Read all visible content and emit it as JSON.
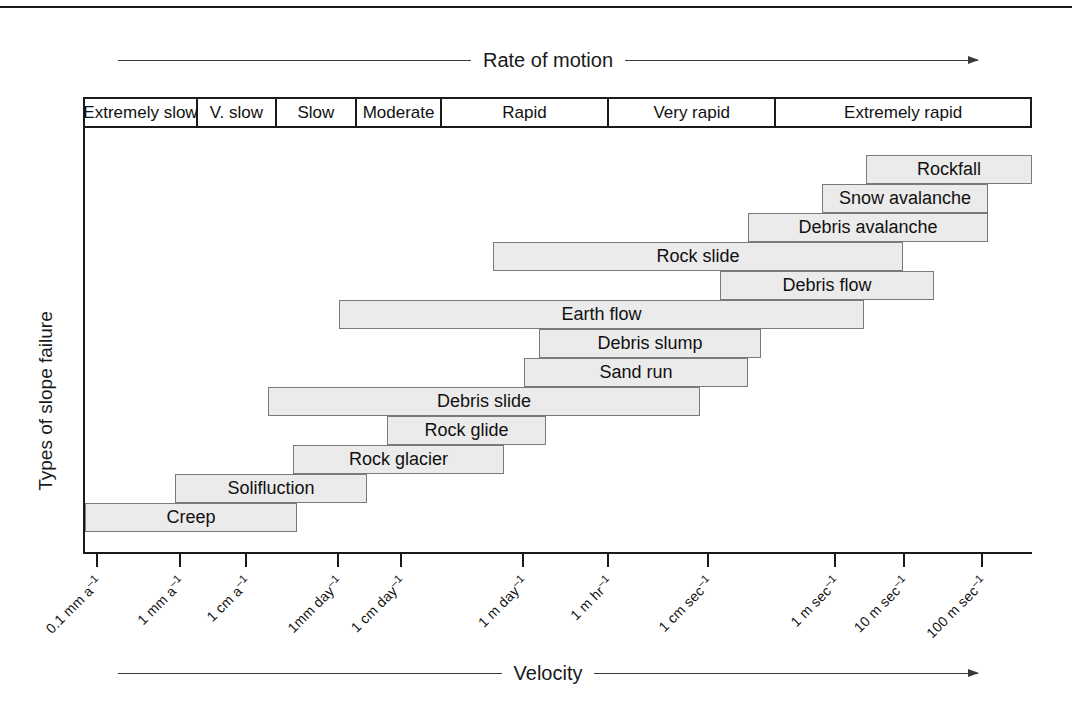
{
  "figure": {
    "top_axis_caption": "Rate of motion",
    "bottom_axis_caption": "Velocity",
    "y_axis_title": "Types of slope failure"
  },
  "rate_classes": [
    {
      "label": "Extremely slow",
      "left": 83,
      "width": 113
    },
    {
      "label": "V. slow",
      "left": 196,
      "width": 79
    },
    {
      "label": "Slow",
      "left": 275,
      "width": 81
    },
    {
      "label": "Moderate",
      "left": 356,
      "width": 85
    },
    {
      "label": "Rapid",
      "left": 441,
      "width": 168
    },
    {
      "label": "Very rapid",
      "left": 609,
      "width": 168
    },
    {
      "label": "Extremely rapid",
      "left": 777,
      "width": 255
    }
  ],
  "ticks": [
    {
      "label": "0.1 mm a",
      "exp": "–1",
      "x": 96
    },
    {
      "label": "1 mm a",
      "exp": "–1",
      "x": 179
    },
    {
      "label": "1 cm a",
      "exp": "–1",
      "x": 245
    },
    {
      "label": "1mm day",
      "exp": "–1",
      "x": 337
    },
    {
      "label": "1 cm day",
      "exp": "–1",
      "x": 400
    },
    {
      "label": "1 m day",
      "exp": "–1",
      "x": 522
    },
    {
      "label": "1 m hr",
      "exp": "–1",
      "x": 607
    },
    {
      "label": "1 cm sec",
      "exp": "–1",
      "x": 707
    },
    {
      "label": "1 m sec",
      "exp": "–1",
      "x": 834
    },
    {
      "label": "10 m sec",
      "exp": "–1",
      "x": 903
    },
    {
      "label": "100 m sec",
      "exp": "–1",
      "x": 981
    }
  ],
  "bars": [
    {
      "label": "Rockfall",
      "left": 866,
      "width": 166,
      "top": 155
    },
    {
      "label": "Snow avalanche",
      "left": 822,
      "width": 166,
      "top": 184
    },
    {
      "label": "Debris avalanche",
      "left": 748,
      "width": 240,
      "top": 213
    },
    {
      "label": "Rock slide",
      "left": 493,
      "width": 410,
      "top": 242
    },
    {
      "label": "Debris flow",
      "left": 720,
      "width": 214,
      "top": 271
    },
    {
      "label": "Earth flow",
      "left": 339,
      "width": 525,
      "top": 300
    },
    {
      "label": "Debris slump",
      "left": 539,
      "width": 222,
      "top": 329
    },
    {
      "label": "Sand run",
      "left": 524,
      "width": 224,
      "top": 358
    },
    {
      "label": "Debris slide",
      "left": 268,
      "width": 432,
      "top": 387
    },
    {
      "label": "Rock glide",
      "left": 387,
      "width": 159,
      "top": 416
    },
    {
      "label": "Rock glacier",
      "left": 293,
      "width": 211,
      "top": 445
    },
    {
      "label": "Solifluction",
      "left": 175,
      "width": 192,
      "top": 474
    },
    {
      "label": "Creep",
      "left": 85,
      "width": 212,
      "top": 503
    }
  ],
  "chart_data": {
    "type": "bar",
    "xlabel": "Velocity",
    "ylabel": "Types of slope failure",
    "grid": false,
    "legend": "none",
    "x_axis_scale": "logarithmic (velocity)",
    "x_tick_labels": [
      "0.1 mm a–1",
      "1 mm a–1",
      "1 cm a–1",
      "1mm day–1",
      "1 cm day–1",
      "1 m day–1",
      "1 m hr–1",
      "1 cm sec–1",
      "1 m sec–1",
      "10 m sec–1",
      "100 m sec–1"
    ],
    "rate_class_bands": [
      "Extremely slow",
      "V. slow",
      "Slow",
      "Moderate",
      "Rapid",
      "Very rapid",
      "Extremely rapid"
    ],
    "categories": [
      "Rockfall",
      "Snow avalanche",
      "Debris avalanche",
      "Rock slide",
      "Debris flow",
      "Earth flow",
      "Debris slump",
      "Sand run",
      "Debris slide",
      "Rock glide",
      "Rock glacier",
      "Solifluction",
      "Creep"
    ],
    "ranges": [
      {
        "category": "Rockfall",
        "from": "1 m sec–1",
        "to": "100 m sec–1"
      },
      {
        "category": "Snow avalanche",
        "from": "1 m sec–1",
        "to": "100 m sec–1"
      },
      {
        "category": "Debris avalanche",
        "from": "1 cm sec–1",
        "to": "100 m sec–1"
      },
      {
        "category": "Rock slide",
        "from": "1 m day–1",
        "to": "10 m sec–1"
      },
      {
        "category": "Debris flow",
        "from": "1 cm sec–1",
        "to": "10 m sec–1"
      },
      {
        "category": "Earth flow",
        "from": "1 cm day–1",
        "to": "1 m sec–1"
      },
      {
        "category": "Debris slump",
        "from": "1 m day–1",
        "to": "1 cm sec–1"
      },
      {
        "category": "Sand run",
        "from": "1 m day–1",
        "to": "1 cm sec–1"
      },
      {
        "category": "Debris slide",
        "from": "1 cm a–1",
        "to": "1 cm sec–1"
      },
      {
        "category": "Rock glide",
        "from": "1 cm day–1",
        "to": "1 m day–1"
      },
      {
        "category": "Rock glacier",
        "from": "1 cm a–1",
        "to": "1 cm day–1"
      },
      {
        "category": "Solifluction",
        "from": "1 mm a–1",
        "to": "1mm day–1"
      },
      {
        "category": "Creep",
        "from": "0.1 mm a–1",
        "to": "1 cm a–1"
      }
    ]
  }
}
